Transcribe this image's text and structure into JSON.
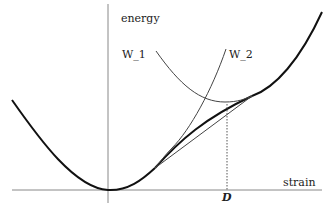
{
  "diagram": {
    "axis_labels": {
      "y": "energy",
      "x": "strain"
    },
    "curve_labels": {
      "w1": "W_1",
      "w2": "W_2"
    },
    "marker_label": "D",
    "colors": {
      "axis": "#888888",
      "thin_curve": "#444444",
      "thick_curve": "#111111",
      "text": "#222222"
    }
  }
}
